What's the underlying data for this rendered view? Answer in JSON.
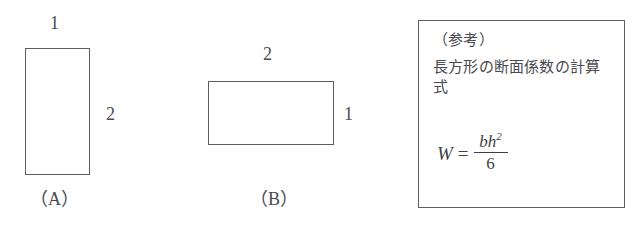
{
  "figures": [
    {
      "id": "A",
      "name_label": "（A）",
      "width_label": "1",
      "height_label": "2",
      "orientation": "portrait"
    },
    {
      "id": "B",
      "name_label": "（B）",
      "width_label": "2",
      "height_label": "1",
      "orientation": "landscape"
    }
  ],
  "reference": {
    "heading": "（参考）",
    "body": "長方形の断面係数の計算式",
    "formula": {
      "lhs": "W",
      "equals": "=",
      "numerator": "bh",
      "numerator_exponent": "2",
      "denominator": "6",
      "plain": "W = bh² / 6"
    }
  },
  "colors": {
    "background": "#ffffff",
    "stroke": "#5d5d63",
    "text": "#4a4a50"
  }
}
